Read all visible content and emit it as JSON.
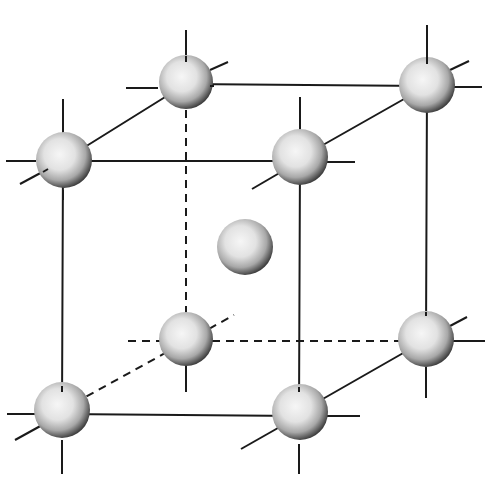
{
  "diagram": {
    "type": "crystal-lattice",
    "colors": {
      "line": "#1a1a1a",
      "atom_light": "#f4f4f4",
      "atom_mid": "#bdbdbd",
      "atom_dark": "#3a3a3a",
      "background": "#ffffff"
    },
    "atom_radius": 27,
    "atoms": [
      {
        "id": "back-top-left",
        "x": 186,
        "y": 82,
        "hidden": false
      },
      {
        "id": "back-top-right",
        "x": 427,
        "y": 85,
        "hidden": false
      },
      {
        "id": "front-top-left",
        "x": 64,
        "y": 160,
        "hidden": false
      },
      {
        "id": "front-top-right",
        "x": 300,
        "y": 157,
        "hidden": false
      },
      {
        "id": "body-center",
        "x": 245,
        "y": 247,
        "hidden": false
      },
      {
        "id": "back-bottom-left",
        "x": 186,
        "y": 340,
        "hidden": true
      },
      {
        "id": "back-bottom-right",
        "x": 426,
        "y": 339,
        "hidden": false
      },
      {
        "id": "front-bottom-left",
        "x": 62,
        "y": 410,
        "hidden": false
      },
      {
        "id": "front-bottom-right",
        "x": 300,
        "y": 412,
        "hidden": false
      }
    ],
    "edges": {
      "solid": 9,
      "dashed": 3
    }
  }
}
